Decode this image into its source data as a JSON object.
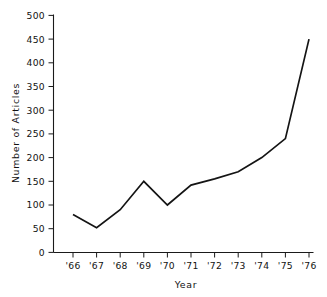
{
  "chart_data": {
    "type": "line",
    "title": "",
    "xlabel": "Year",
    "ylabel": "Number of Articles",
    "categories": [
      "'66",
      "'67",
      "'68",
      "'69",
      "'70",
      "'71",
      "'72",
      "'73",
      "'74",
      "'75",
      "'76"
    ],
    "x_values": [
      1966,
      1967,
      1968,
      1969,
      1970,
      1971,
      1972,
      1973,
      1974,
      1975,
      1976
    ],
    "values": [
      80,
      52,
      90,
      150,
      100,
      142,
      155,
      170,
      200,
      240,
      450
    ],
    "series": [
      {
        "name": "Number of Articles",
        "values": [
          80,
          52,
          90,
          150,
          100,
          142,
          155,
          170,
          200,
          240,
          450
        ]
      }
    ],
    "xlim": [
      1965.6,
      1976.2
    ],
    "ylim": [
      0,
      500
    ],
    "y_ticks": [
      0,
      50,
      100,
      150,
      200,
      250,
      300,
      350,
      400,
      450,
      500
    ],
    "y_tick_labels": [
      "0",
      "50",
      "100",
      "150",
      "200",
      "250",
      "300",
      "350",
      "400",
      "450",
      "500"
    ],
    "x_tick_labels": [
      "'66",
      "'67",
      "'68",
      "'69",
      "'70",
      "'71",
      "'72",
      "'73",
      "'74",
      "'75",
      "'76"
    ],
    "grid": false,
    "legend": false,
    "legend_position": "none",
    "line_color": "#141414",
    "background_color": "#ffffff",
    "markers": false,
    "spines": [
      "left",
      "bottom"
    ],
    "tick_direction": "out"
  }
}
